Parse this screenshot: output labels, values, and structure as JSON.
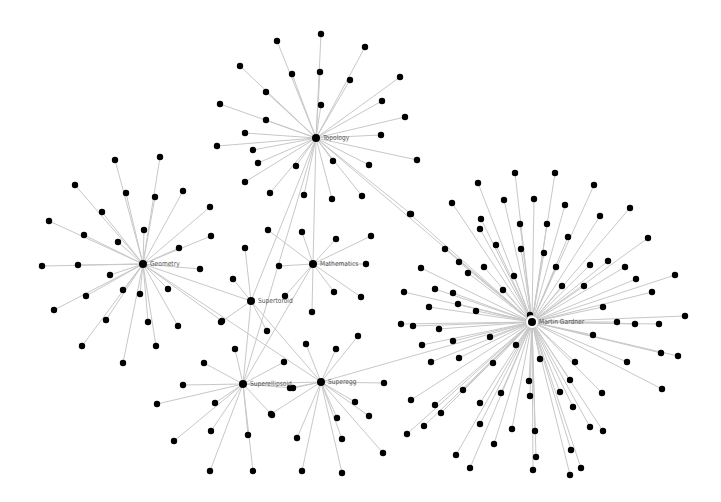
{
  "graph": {
    "title": "",
    "colors": {
      "node": "#000000",
      "edge": "#c8c8c8",
      "label": "#555555",
      "background": "#ffffff"
    },
    "hubs": [
      {
        "id": "topology",
        "label": "Topology",
        "x": 316,
        "y": 138,
        "r": 4,
        "leaves": [
          [
            321,
            34
          ],
          [
            277,
            41
          ],
          [
            365,
            47
          ],
          [
            240,
            66
          ],
          [
            292,
            74
          ],
          [
            320,
            72
          ],
          [
            350,
            80
          ],
          [
            400,
            77
          ],
          [
            220,
            104
          ],
          [
            266,
            92
          ],
          [
            321,
            105
          ],
          [
            217,
            146
          ],
          [
            266,
            120
          ],
          [
            245,
            133
          ],
          [
            381,
            135
          ],
          [
            382,
            101
          ],
          [
            405,
            117
          ],
          [
            417,
            160
          ],
          [
            253,
            150
          ],
          [
            296,
            166
          ],
          [
            258,
            163
          ],
          [
            333,
            161
          ],
          [
            369,
            165
          ],
          [
            245,
            182
          ],
          [
            270,
            193
          ],
          [
            304,
            195
          ],
          [
            332,
            199
          ],
          [
            362,
            196
          ],
          [
            411,
            214
          ]
        ]
      },
      {
        "id": "geometry",
        "label": "Geometry",
        "x": 143,
        "y": 264,
        "r": 4,
        "leaves": [
          [
            160,
            157
          ],
          [
            115,
            160
          ],
          [
            126,
            193
          ],
          [
            75,
            185
          ],
          [
            102,
            212
          ],
          [
            155,
            197
          ],
          [
            183,
            191
          ],
          [
            210,
            207
          ],
          [
            49,
            221
          ],
          [
            84,
            235
          ],
          [
            118,
            242
          ],
          [
            144,
            230
          ],
          [
            211,
            236
          ],
          [
            179,
            248
          ],
          [
            42,
            266
          ],
          [
            78,
            265
          ],
          [
            200,
            269
          ],
          [
            110,
            275
          ],
          [
            86,
            296
          ],
          [
            123,
            290
          ],
          [
            168,
            289
          ],
          [
            54,
            310
          ],
          [
            140,
            294
          ],
          [
            106,
            320
          ],
          [
            148,
            322
          ],
          [
            178,
            326
          ],
          [
            82,
            346
          ],
          [
            156,
            346
          ],
          [
            123,
            363
          ],
          [
            222,
            321
          ]
        ]
      },
      {
        "id": "mathematics",
        "label": "Mathematics",
        "x": 313,
        "y": 264,
        "r": 4,
        "leaves": [
          [
            268,
            230
          ],
          [
            302,
            232
          ],
          [
            336,
            239
          ],
          [
            371,
            236
          ],
          [
            279,
            266
          ],
          [
            366,
            264
          ],
          [
            285,
            296
          ],
          [
            334,
            292
          ],
          [
            361,
            297
          ],
          [
            312,
            312
          ]
        ]
      },
      {
        "id": "supertoroid",
        "label": "Supertoroid",
        "x": 251,
        "y": 301,
        "r": 4,
        "leaves": [
          [
            245,
            248
          ],
          [
            233,
            279
          ],
          [
            221,
            322
          ],
          [
            267,
            331
          ]
        ]
      },
      {
        "id": "superellipsoid",
        "label": "Superellipsoid",
        "x": 243,
        "y": 384,
        "r": 4,
        "leaves": [
          [
            235,
            349
          ],
          [
            204,
            363
          ],
          [
            183,
            385
          ],
          [
            157,
            404
          ],
          [
            215,
            403
          ],
          [
            284,
            362
          ],
          [
            272,
            415
          ],
          [
            211,
            431
          ],
          [
            248,
            435
          ],
          [
            174,
            441
          ],
          [
            210,
            471
          ],
          [
            253,
            471
          ]
        ]
      },
      {
        "id": "superegg",
        "label": "Superegg",
        "x": 321,
        "y": 382,
        "r": 4,
        "leaves": [
          [
            306,
            344
          ],
          [
            336,
            349
          ],
          [
            358,
            336
          ],
          [
            384,
            383
          ],
          [
            290,
            388
          ],
          [
            271,
            414
          ],
          [
            355,
            402
          ],
          [
            369,
            416
          ],
          [
            337,
            418
          ],
          [
            297,
            438
          ],
          [
            342,
            439
          ],
          [
            383,
            453
          ],
          [
            302,
            471
          ],
          [
            342,
            473
          ]
        ]
      },
      {
        "id": "martin-gardner",
        "label": "Martin Gardner",
        "x": 532,
        "y": 322,
        "r": 4,
        "ring": true,
        "leaves": [
          [
            515,
            173
          ],
          [
            555,
            173
          ],
          [
            478,
            183
          ],
          [
            594,
            185
          ],
          [
            452,
            203
          ],
          [
            504,
            200
          ],
          [
            534,
            199
          ],
          [
            565,
            205
          ],
          [
            630,
            208
          ],
          [
            410,
            214
          ],
          [
            481,
            219
          ],
          [
            520,
            224
          ],
          [
            547,
            224
          ],
          [
            600,
            216
          ],
          [
            480,
            229
          ],
          [
            568,
            237
          ],
          [
            648,
            238
          ],
          [
            445,
            249
          ],
          [
            496,
            245
          ],
          [
            521,
            249
          ],
          [
            544,
            253
          ],
          [
            459,
            262
          ],
          [
            608,
            261
          ],
          [
            590,
            265
          ],
          [
            421,
            268
          ],
          [
            468,
            273
          ],
          [
            484,
            267
          ],
          [
            556,
            267
          ],
          [
            625,
            267
          ],
          [
            675,
            275
          ],
          [
            514,
            276
          ],
          [
            584,
            286
          ],
          [
            636,
            279
          ],
          [
            404,
            292
          ],
          [
            435,
            289
          ],
          [
            453,
            293
          ],
          [
            503,
            290
          ],
          [
            562,
            286
          ],
          [
            652,
            292
          ],
          [
            429,
            307
          ],
          [
            458,
            304
          ],
          [
            476,
            311
          ],
          [
            530,
            315
          ],
          [
            603,
            307
          ],
          [
            617,
            322
          ],
          [
            635,
            324
          ],
          [
            685,
            316
          ],
          [
            401,
            324
          ],
          [
            413,
            326
          ],
          [
            439,
            329
          ],
          [
            593,
            335
          ],
          [
            659,
            324
          ],
          [
            422,
            345
          ],
          [
            453,
            341
          ],
          [
            490,
            337
          ],
          [
            516,
            345
          ],
          [
            661,
            353
          ],
          [
            678,
            356
          ],
          [
            431,
            362
          ],
          [
            459,
            358
          ],
          [
            493,
            363
          ],
          [
            540,
            359
          ],
          [
            575,
            362
          ],
          [
            627,
            362
          ],
          [
            570,
            380
          ],
          [
            463,
            390
          ],
          [
            411,
            400
          ],
          [
            501,
            393
          ],
          [
            529,
            381
          ],
          [
            560,
            392
          ],
          [
            602,
            393
          ],
          [
            662,
            389
          ],
          [
            435,
            405
          ],
          [
            480,
            403
          ],
          [
            530,
            396
          ],
          [
            573,
            407
          ],
          [
            441,
            413
          ],
          [
            480,
            424
          ],
          [
            512,
            429
          ],
          [
            590,
            427
          ],
          [
            603,
            431
          ],
          [
            424,
            426
          ],
          [
            456,
            455
          ],
          [
            535,
            431
          ],
          [
            470,
            468
          ],
          [
            494,
            444
          ],
          [
            536,
            457
          ],
          [
            571,
            450
          ],
          [
            581,
            468
          ],
          [
            407,
            434
          ],
          [
            533,
            470
          ],
          [
            570,
            475
          ]
        ]
      }
    ],
    "cross_edges": [
      [
        "topology",
        "supertoroid"
      ],
      [
        "topology",
        "superellipsoid"
      ],
      [
        "topology",
        "martin-gardner"
      ],
      [
        "topology",
        "mathematics"
      ],
      [
        "geometry",
        "supertoroid"
      ],
      [
        "geometry",
        "superegg"
      ],
      [
        "mathematics",
        "superellipsoid"
      ],
      [
        "supertoroid",
        "superellipsoid"
      ],
      [
        "supertoroid",
        "superegg"
      ],
      [
        "superellipsoid",
        "superegg"
      ],
      [
        "superegg",
        "martin-gardner"
      ]
    ],
    "shared_leaves": [
      {
        "x": 293,
        "y": 388,
        "hubs": [
          "superellipsoid",
          "superegg"
        ]
      }
    ]
  }
}
